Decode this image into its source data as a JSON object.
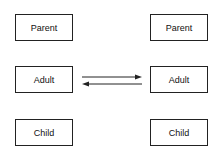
{
  "left_column": {
    "boxes": [
      {
        "label": "Parent"
      },
      {
        "label": "Adult"
      },
      {
        "label": "Child"
      }
    ]
  },
  "right_column": {
    "boxes": [
      {
        "label": "Parent"
      },
      {
        "label": "Adult"
      },
      {
        "label": "Child"
      }
    ]
  },
  "connections": [
    {
      "from": "left.Adult",
      "to": "right.Adult",
      "direction": "right"
    },
    {
      "from": "right.Adult",
      "to": "left.Adult",
      "direction": "left"
    }
  ]
}
